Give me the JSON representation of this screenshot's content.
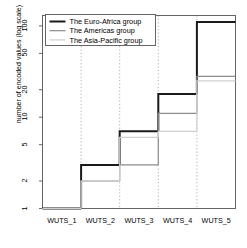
{
  "chart_data": {
    "type": "line",
    "subtype": "step",
    "title": "",
    "xlabel": "",
    "ylabel": "number of encoded values (log scale)",
    "categories": [
      "WUTS_1",
      "WUTS_2",
      "WUTS_3",
      "WUTS_4",
      "WUTS_5"
    ],
    "yscale": "log",
    "ylim": [
      1,
      130
    ],
    "ytick_values": [
      1,
      2,
      5,
      10,
      20,
      50,
      100
    ],
    "ytick_labels": [
      "1",
      "2",
      "5",
      "10",
      "20",
      "50",
      "100"
    ],
    "grid": "vertical-dotted",
    "legend_position": "top-left",
    "series": [
      {
        "name": "The Euro-Africa group",
        "values": [
          1,
          3,
          7,
          18,
          110
        ],
        "color": "#1a1a1a",
        "linewidth": 2.0
      },
      {
        "name": "The Americas group",
        "values": [
          1,
          2,
          3,
          11,
          28
        ],
        "color": "#8c8c8c",
        "linewidth": 1.2
      },
      {
        "name": "The Asia-Pacific group",
        "values": [
          1,
          2,
          6,
          7,
          25
        ],
        "color": "#cfcfcf",
        "linewidth": 1.2
      }
    ]
  },
  "legend": {
    "entries": [
      {
        "label": "The Euro-Africa group"
      },
      {
        "label": "The Americas group"
      },
      {
        "label": "The Asia-Pacific group"
      }
    ]
  },
  "axes": {
    "y_label": "number of encoded values (log scale)",
    "y_ticks": [
      "100",
      "50",
      "20",
      "10",
      "5",
      "2",
      "1"
    ],
    "x_ticks": [
      "WUTS_1",
      "WUTS_2",
      "WUTS_3",
      "WUTS_4",
      "WUTS_5"
    ]
  }
}
